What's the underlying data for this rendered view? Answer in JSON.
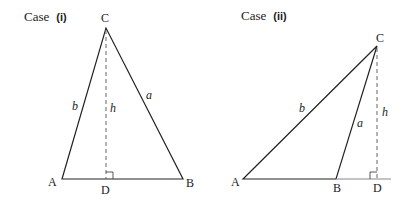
{
  "colors": {
    "line": "#222222",
    "altitude": "#666666",
    "extension": "#888888",
    "background": "#ffffff"
  },
  "case_i": {
    "title_prefix": "Case",
    "title_num": "(i)",
    "vertices": {
      "A": "A",
      "B": "B",
      "C": "C",
      "D": "D"
    },
    "sides": {
      "a": "a",
      "b": "b",
      "h": "h"
    }
  },
  "case_ii": {
    "title_prefix": "Case",
    "title_num": "(ii)",
    "vertices": {
      "A": "A",
      "B": "B",
      "C": "C",
      "D": "D"
    },
    "sides": {
      "a": "a",
      "b": "b",
      "h": "h"
    }
  }
}
